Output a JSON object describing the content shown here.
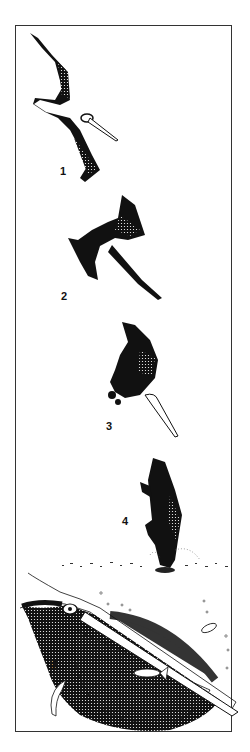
{
  "figure": {
    "type": "illustration",
    "stages": [
      {
        "label": "1",
        "description": "soaring with wings spread"
      },
      {
        "label": "2",
        "description": "banking into dive"
      },
      {
        "label": "3",
        "description": "plunging head-down"
      },
      {
        "label": "4",
        "description": "hitting the water"
      },
      {
        "label": "5",
        "description": "pouch full of water with fish"
      }
    ],
    "colors": {
      "ink": "#111111",
      "paper": "#ffffff",
      "frame": "#333333"
    }
  }
}
